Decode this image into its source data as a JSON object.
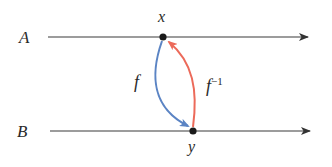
{
  "diagram": {
    "lines": [
      {
        "id": "A",
        "label": "A"
      },
      {
        "id": "B",
        "label": "B"
      }
    ],
    "points": [
      {
        "id": "x",
        "label": "x",
        "on_line": "A"
      },
      {
        "id": "y",
        "label": "y",
        "on_line": "B"
      }
    ],
    "arrows": [
      {
        "id": "f",
        "label": "f",
        "from": "x",
        "to": "y",
        "color": "#5b84c4"
      },
      {
        "id": "f_inverse",
        "label": "f",
        "superscript": "−1",
        "from": "y",
        "to": "x",
        "color": "#ec6a5a"
      }
    ],
    "colors": {
      "line": "#3a3a3a",
      "point": "#1a1a1a",
      "f_arrow": "#5b84c4",
      "f_inverse_arrow": "#ec6a5a"
    }
  }
}
